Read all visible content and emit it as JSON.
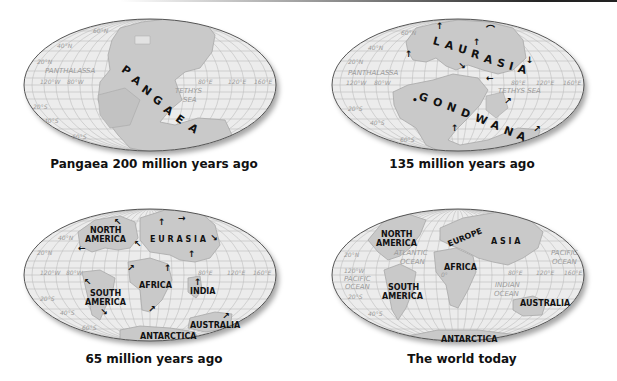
{
  "colors": {
    "ocean": "#ececec",
    "land": "#c9c9c9",
    "land_stroke": "#a8a8a8",
    "grid": "#b8b8b8",
    "outline": "#555555",
    "text": "#111111",
    "grid_text": "#9a9a9a"
  },
  "panels": [
    {
      "id": "pangaea",
      "caption": "Pangaea 200 million years ago",
      "supercontinent_letters": [
        "P",
        "A",
        "N",
        "G",
        "A",
        "E",
        "A"
      ],
      "oceans": {
        "panthalassa": "PANTHALASSA",
        "tethys_1": "TETHYS",
        "tethys_2": "SEA"
      },
      "grid_labels": {
        "lat_60n": "60°N",
        "lat_40n": "40°N",
        "lat_20n": "20°N",
        "lon_120w": "120°W",
        "lon_80w": "80°W",
        "lon_80e": "80°E",
        "lon_120e": "120°E",
        "lon_160e": "160°E",
        "lat_20s": "20°S",
        "lat_40s": "40°S",
        "lat_60s": "60°S"
      }
    },
    {
      "id": "135mya",
      "caption": "135 million years ago",
      "laurasia_letters": [
        "L",
        "A",
        "U",
        "R",
        "A",
        "S",
        "I",
        "A"
      ],
      "gondwana_letters": [
        "G",
        "O",
        "N",
        "D",
        "W",
        "A",
        "N",
        "A"
      ],
      "oceans": {
        "panthalassa": "PANTHALASSA",
        "tethys": "TETHYS SEA"
      },
      "grid_labels": {
        "lat_60n": "60°N",
        "lat_40n": "40°N",
        "lat_20n": "20°N",
        "lon_120w": "120°W",
        "lon_80w": "80°W",
        "lon_80e": "80°E",
        "lon_120e": "120°E",
        "lon_160e": "160°E",
        "lat_20s": "20°S",
        "lat_40s": "40°S",
        "lat_60s": "60°S"
      }
    },
    {
      "id": "65mya",
      "caption": "65 million years ago",
      "continents": {
        "north_america_1": "NORTH",
        "north_america_2": "AMERICA",
        "eurasia": "E U R A S I A",
        "africa": "AFRICA",
        "south_america_1": "SOUTH",
        "south_america_2": "AMERICA",
        "india": "INDIA",
        "australia": "AUSTRALIA",
        "antarctica": "ANTARCTICA"
      },
      "grid_labels": {
        "lat_40n": "40°N",
        "lat_20n": "20°N",
        "lon_120w": "120°W",
        "lon_80w": "80°W",
        "lon_80e": "80°E",
        "lon_120e": "120°E",
        "lon_160e": "160°E",
        "lat_20s": "20°S",
        "lat_40s": "40°S",
        "lat_60s": "60°S"
      }
    },
    {
      "id": "today",
      "caption": "The world today",
      "continents": {
        "north_america_1": "NORTH",
        "north_america_2": "AMERICA",
        "europe": "EUROPE",
        "asia": "A S I A",
        "africa": "AFRICA",
        "south_america_1": "SOUTH",
        "south_america_2": "AMERICA",
        "australia": "AUSTRALIA",
        "antarctica": "ANTARCTICA"
      },
      "oceans": {
        "atlantic_1": "ATLANTIC",
        "atlantic_2": "OCEAN",
        "pacific_w_1": "PACIFIC",
        "pacific_w_2": "OCEAN",
        "pacific_e_1": "PACIFIC",
        "pacific_e_2": "OCEAN",
        "indian_1": "INDIAN",
        "indian_2": "OCEAN"
      },
      "grid_labels": {
        "lat_20n": "20°N",
        "lon_120w": "120°W",
        "lon_0": "0°",
        "lon_80e": "80°E",
        "lon_120e": "120°E",
        "lon_160e": "160°E",
        "lat_20s": "20°S",
        "lat_40s": "40°S"
      }
    }
  ]
}
